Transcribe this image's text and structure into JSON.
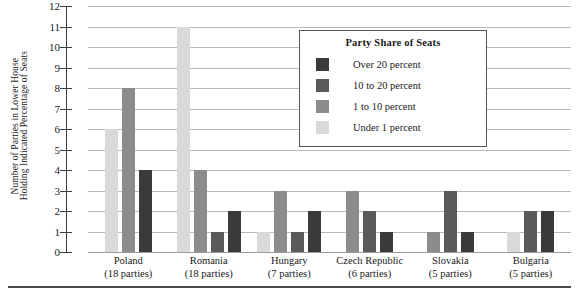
{
  "chart_data": {
    "type": "bar",
    "title": "",
    "xlabel": "",
    "ylabel": "Number of Parties in Lower House Holding Indicated Percentage of Seats",
    "ylabel_lines": [
      "Number of Parties in Lower House",
      "Holding Indicated Percentage of Seats"
    ],
    "ylim": [
      0,
      12
    ],
    "ytick_labels": [
      "0",
      "1",
      "2",
      "3",
      "4",
      "5",
      "6",
      "7",
      "8",
      "9",
      "10",
      "11",
      "12"
    ],
    "grid": "horizontal",
    "legend_position": "inside-top-right",
    "legend_title": "Party Share of Seats",
    "categories": [
      "Poland",
      "Romania",
      "Hungary",
      "Czech Republic",
      "Slovakia",
      "Bulgaria"
    ],
    "category_sublabels": [
      "(18 parties)",
      "(18 parties)",
      "(7 parties)",
      "(6 parties)",
      "(5 parties)",
      "(5 parties)"
    ],
    "series": [
      {
        "name": "Over 20 percent",
        "color": "#3a3a3a",
        "values": [
          4,
          2,
          2,
          1,
          1,
          2
        ]
      },
      {
        "name": "10 to 20 percent",
        "color": "#5a5a5a",
        "values": [
          0,
          1,
          1,
          2,
          3,
          2
        ]
      },
      {
        "name": "1 to 10 percent",
        "color": "#8c8c8c",
        "values": [
          8,
          4,
          3,
          3,
          1,
          0
        ]
      },
      {
        "name": "Under 1 percent",
        "color": "#d9d9d9",
        "values": [
          6,
          11,
          1,
          0,
          0,
          1
        ]
      }
    ],
    "bar_draw_order": [
      "Under 1 percent",
      "1 to 10 percent",
      "10 to 20 percent",
      "Over 20 percent"
    ],
    "groups": [
      {
        "category": "Poland",
        "sublabel": "(18 parties)",
        "bars": [
          {
            "series": "Under 1 percent",
            "value": 6,
            "color": "#d9d9d9"
          },
          {
            "series": "1 to 10 percent",
            "value": 8,
            "color": "#8c8c8c"
          },
          {
            "series": "Over 20 percent",
            "value": 4,
            "color": "#3a3a3a"
          }
        ]
      },
      {
        "category": "Romania",
        "sublabel": "(18 parties)",
        "bars": [
          {
            "series": "Under 1 percent",
            "value": 11,
            "color": "#d9d9d9"
          },
          {
            "series": "1 to 10 percent",
            "value": 4,
            "color": "#8c8c8c"
          },
          {
            "series": "10 to 20 percent",
            "value": 1,
            "color": "#5a5a5a"
          },
          {
            "series": "Over 20 percent",
            "value": 2,
            "color": "#3a3a3a"
          }
        ]
      },
      {
        "category": "Hungary",
        "sublabel": "(7 parties)",
        "bars": [
          {
            "series": "Under 1 percent",
            "value": 1,
            "color": "#d9d9d9"
          },
          {
            "series": "1 to 10 percent",
            "value": 3,
            "color": "#8c8c8c"
          },
          {
            "series": "10 to 20 percent",
            "value": 1,
            "color": "#5a5a5a"
          },
          {
            "series": "Over 20 percent",
            "value": 2,
            "color": "#3a3a3a"
          }
        ]
      },
      {
        "category": "Czech Republic",
        "sublabel": "(6 parties)",
        "bars": [
          {
            "series": "1 to 10 percent",
            "value": 3,
            "color": "#8c8c8c"
          },
          {
            "series": "10 to 20 percent",
            "value": 2,
            "color": "#5a5a5a"
          },
          {
            "series": "Over 20 percent",
            "value": 1,
            "color": "#3a3a3a"
          }
        ]
      },
      {
        "category": "Slovakia",
        "sublabel": "(5 parties)",
        "bars": [
          {
            "series": "1 to 10 percent",
            "value": 1,
            "color": "#8c8c8c"
          },
          {
            "series": "10 to 20 percent",
            "value": 3,
            "color": "#5a5a5a"
          },
          {
            "series": "Over 20 percent",
            "value": 1,
            "color": "#3a3a3a"
          }
        ]
      },
      {
        "category": "Bulgaria",
        "sublabel": "(5 parties)",
        "bars": [
          {
            "series": "Under 1 percent",
            "value": 1,
            "color": "#d9d9d9"
          },
          {
            "series": "10 to 20 percent",
            "value": 2,
            "color": "#5a5a5a"
          },
          {
            "series": "Over 20 percent",
            "value": 2,
            "color": "#3a3a3a"
          }
        ]
      }
    ],
    "legend_entries": [
      {
        "label": "Over 20 percent",
        "color": "#3a3a3a"
      },
      {
        "label": "10 to 20 percent",
        "color": "#5a5a5a"
      },
      {
        "label": "1 to 10 percent",
        "color": "#8c8c8c"
      },
      {
        "label": "Under 1 percent",
        "color": "#d9d9d9"
      }
    ]
  }
}
